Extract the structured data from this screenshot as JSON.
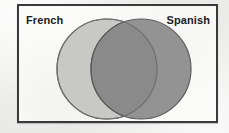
{
  "diagram": {
    "type": "venn",
    "title": "",
    "sets": [
      {
        "id": "french",
        "label": "French",
        "label_position": "top-left",
        "fill_color": "#c8c8c6",
        "stroke_color": "#6f6f70",
        "circle": {
          "cx": 88,
          "cy": 63,
          "r": 50
        }
      },
      {
        "id": "spanish",
        "label": "Spanish",
        "label_position": "top-right",
        "fill_color": "#8f8f8f",
        "stroke_color": "#5c5c5d",
        "circle": {
          "cx": 122,
          "cy": 63,
          "r": 50
        }
      }
    ],
    "intersection": {
      "label": "",
      "fill_color": "#8a8a8a",
      "stroke_color": "#555556"
    },
    "frame": {
      "border_color": "#3a3a3c",
      "background_color": "#fbfbf9"
    },
    "page_background_color": "#e9e9e7"
  }
}
